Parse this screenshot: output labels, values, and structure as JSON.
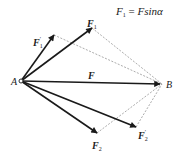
{
  "equation": {
    "lhs_symbol": "F",
    "lhs_sub": "1",
    "equals": " = ",
    "rhs": "Fsinα"
  },
  "points": {
    "A": {
      "label": "A",
      "x": 21,
      "y": 81
    },
    "B": {
      "label": "B",
      "x": 162,
      "y": 84
    }
  },
  "vectors": [
    {
      "id": "F1prime",
      "symbol": "F",
      "sub": "1",
      "prime": "′",
      "tip": [
        54,
        35
      ],
      "label_pos": [
        34,
        44
      ]
    },
    {
      "id": "F1",
      "symbol": "F",
      "sub": "1",
      "prime": "",
      "tip": [
        92,
        28
      ],
      "label_pos": [
        88,
        22
      ]
    },
    {
      "id": "F",
      "symbol": "F",
      "sub": "",
      "prime": "",
      "tip": [
        160,
        84
      ],
      "label_pos": [
        88,
        77
      ]
    },
    {
      "id": "F2",
      "symbol": "F",
      "sub": "2",
      "prime": "",
      "tip": [
        97,
        133
      ],
      "label_pos": [
        92,
        148
      ]
    },
    {
      "id": "F2prime",
      "symbol": "F",
      "sub": "2",
      "prime": "′",
      "tip": [
        136,
        127
      ],
      "label_pos": [
        137,
        138
      ]
    }
  ],
  "colors": {
    "vector": "#1a1a1a",
    "dashed": "#888888",
    "text": "#222222"
  }
}
